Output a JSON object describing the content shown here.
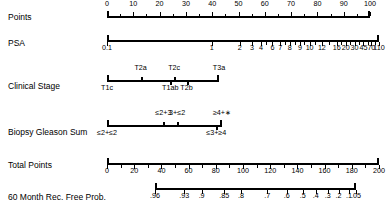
{
  "figure": {
    "type": "nomogram",
    "title": "",
    "background_color": "#ffffff",
    "line_color": "#000000",
    "width": 392,
    "height": 207
  },
  "rows": [
    {
      "id": "points",
      "label": "Points",
      "label_x": 8,
      "label_y": 12,
      "axis": {
        "x": 107,
        "y": 16,
        "width": 263,
        "scale": "linear",
        "range": [
          0,
          100
        ],
        "caps": "both",
        "labels_position": "above",
        "major_ticks": [
          {
            "value": "0",
            "pos": 0.0
          },
          {
            "value": "10",
            "pos": 0.1
          },
          {
            "value": "20",
            "pos": 0.2
          },
          {
            "value": "30",
            "pos": 0.3
          },
          {
            "value": "40",
            "pos": 0.4
          },
          {
            "value": "50",
            "pos": 0.5
          },
          {
            "value": "60",
            "pos": 0.6
          },
          {
            "value": "70",
            "pos": 0.7
          },
          {
            "value": "80",
            "pos": 0.8
          },
          {
            "value": "90",
            "pos": 0.9
          },
          {
            "value": "100",
            "pos": 1.0
          }
        ],
        "minor_ticks": [
          0.05,
          0.15,
          0.25,
          0.35,
          0.45,
          0.55,
          0.65,
          0.75,
          0.85,
          0.95
        ]
      }
    },
    {
      "id": "psa",
      "label": "PSA",
      "label_x": 8,
      "label_y": 38,
      "axis": {
        "x": 107,
        "y": 40,
        "width": 272,
        "scale": "log",
        "range": [
          0.1,
          110
        ],
        "caps": "both",
        "labels_position": "below",
        "major_ticks": [
          {
            "value": "0.1",
            "pos": 0.0
          },
          {
            "value": "1",
            "pos": 0.385
          },
          {
            "value": "2",
            "pos": 0.488
          },
          {
            "value": "3",
            "pos": 0.533
          },
          {
            "value": "4",
            "pos": 0.566
          },
          {
            "value": "6",
            "pos": 0.608
          },
          {
            "value": "7",
            "pos": 0.637
          },
          {
            "value": "8",
            "pos": 0.672
          },
          {
            "value": "9",
            "pos": 0.71
          },
          {
            "value": "10",
            "pos": 0.745
          },
          {
            "value": "12",
            "pos": 0.79
          },
          {
            "value": "16",
            "pos": 0.845
          },
          {
            "value": "20",
            "pos": 0.878
          },
          {
            "value": "30",
            "pos": 0.91
          },
          {
            "value": "45",
            "pos": 0.943
          },
          {
            "value": "70",
            "pos": 0.972
          },
          {
            "value": "110",
            "pos": 1.0
          }
        ],
        "minor_ticks": [
          0.585,
          0.655,
          0.69,
          0.725,
          0.765,
          0.815,
          0.862,
          0.895,
          0.927,
          0.958,
          0.986
        ]
      }
    },
    {
      "id": "clinical-stage",
      "label": "Clinical Stage",
      "label_x": 8,
      "label_y": 81,
      "axis": {
        "x": 107,
        "y": 80,
        "width": 112,
        "caps": "both",
        "categories": [
          {
            "value": "T1c",
            "pos": 0.0,
            "side": "below"
          },
          {
            "value": "T2a",
            "pos": 0.3,
            "side": "above"
          },
          {
            "value": "T1ab",
            "pos": 0.565,
            "side": "below"
          },
          {
            "value": "T2c",
            "pos": 0.6,
            "side": "above"
          },
          {
            "value": "T2b",
            "pos": 0.71,
            "side": "below"
          },
          {
            "value": "T3a",
            "pos": 1.0,
            "side": "above"
          }
        ]
      }
    },
    {
      "id": "biopsy-gleason-sum",
      "label": "Biopsy Gleason Sum",
      "label_x": 8,
      "label_y": 127,
      "axis": {
        "x": 107,
        "y": 125,
        "width": 115,
        "caps": "both",
        "categories": [
          {
            "value": "≤2+≤2",
            "pos": 0.0,
            "side": "below"
          },
          {
            "value": "≤2+3",
            "pos": 0.49,
            "side": "above"
          },
          {
            "value": "3+≤2",
            "pos": 0.61,
            "side": "above"
          },
          {
            "value": "≤3+≥4",
            "pos": 0.95,
            "side": "below"
          },
          {
            "value": "≥4+∗",
            "pos": 1.0,
            "side": "above"
          }
        ]
      }
    },
    {
      "id": "total-points",
      "label": "Total Points",
      "label_x": 8,
      "label_y": 160,
      "axis": {
        "x": 107,
        "y": 163,
        "width": 272,
        "scale": "linear",
        "range": [
          0,
          200
        ],
        "caps": "both",
        "labels_position": "below",
        "major_ticks": [
          {
            "value": "0",
            "pos": 0.0
          },
          {
            "value": "20",
            "pos": 0.1
          },
          {
            "value": "40",
            "pos": 0.2
          },
          {
            "value": "60",
            "pos": 0.3
          },
          {
            "value": "80",
            "pos": 0.4
          },
          {
            "value": "100",
            "pos": 0.5
          },
          {
            "value": "120",
            "pos": 0.6
          },
          {
            "value": "140",
            "pos": 0.7
          },
          {
            "value": "160",
            "pos": 0.8
          },
          {
            "value": "180",
            "pos": 0.9
          },
          {
            "value": "200",
            "pos": 1.0
          }
        ],
        "minor_ticks": [
          0.05,
          0.15,
          0.25,
          0.35,
          0.45,
          0.55,
          0.65,
          0.75,
          0.85,
          0.95
        ]
      }
    },
    {
      "id": "rec-free-prob",
      "label": "60 Month Rec. Free Prob.",
      "label_x": 8,
      "label_y": 192,
      "axis": {
        "x": 155,
        "y": 188,
        "width": 201,
        "scale": "probability",
        "range": [
          0.96,
          0.05
        ],
        "caps": "both",
        "labels_position": "below",
        "major_ticks": [
          {
            "value": ".96",
            "pos": 0.0
          },
          {
            "value": ".93",
            "pos": 0.145
          },
          {
            "value": ".9",
            "pos": 0.232
          },
          {
            "value": ".85",
            "pos": 0.345
          },
          {
            "value": ".8",
            "pos": 0.428
          },
          {
            "value": ".7",
            "pos": 0.558
          },
          {
            "value": ".6",
            "pos": 0.655
          },
          {
            "value": ".5",
            "pos": 0.735
          },
          {
            "value": ".4",
            "pos": 0.8
          },
          {
            "value": ".3",
            "pos": 0.86
          },
          {
            "value": ".2",
            "pos": 0.913
          },
          {
            "value": ".1",
            "pos": 0.965
          },
          {
            "value": ".05",
            "pos": 1.0
          }
        ],
        "minor_ticks": []
      }
    }
  ],
  "chart_data": {
    "type": "nomogram",
    "scales": [
      {
        "name": "Points",
        "kind": "points",
        "tick_labels": [
          "0",
          "10",
          "20",
          "30",
          "40",
          "50",
          "60",
          "70",
          "80",
          "90",
          "100"
        ],
        "min": 0,
        "max": 100
      },
      {
        "name": "PSA",
        "kind": "predictor-continuous-log",
        "tick_labels": [
          "0.1",
          "1",
          "2",
          "3",
          "4",
          "6",
          "7",
          "8",
          "9",
          "10",
          "12",
          "16",
          "20",
          "30",
          "45",
          "70",
          "110"
        ],
        "min": 0.1,
        "max": 110
      },
      {
        "name": "Clinical Stage",
        "kind": "predictor-categorical",
        "tick_labels": [
          "T1c",
          "T2a",
          "T1ab",
          "T2c",
          "T2b",
          "T3a"
        ]
      },
      {
        "name": "Biopsy Gleason Sum",
        "kind": "predictor-categorical",
        "tick_labels": [
          "≤2+≤2",
          "≤2+3",
          "3+≤2",
          "≤3+≥4",
          "≥4+∗"
        ]
      },
      {
        "name": "Total Points",
        "kind": "total-points",
        "tick_labels": [
          "0",
          "20",
          "40",
          "60",
          "80",
          "100",
          "120",
          "140",
          "160",
          "180",
          "200"
        ],
        "min": 0,
        "max": 200
      },
      {
        "name": "60 Month Rec. Free Prob.",
        "kind": "outcome-probability",
        "tick_labels": [
          ".96",
          ".93",
          ".9",
          ".85",
          ".8",
          ".7",
          ".6",
          ".5",
          ".4",
          ".3",
          ".2",
          ".1",
          ".05"
        ],
        "min": 0.05,
        "max": 0.96
      }
    ]
  }
}
